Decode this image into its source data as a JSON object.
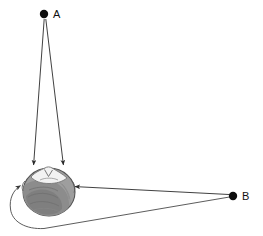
{
  "figure": {
    "background_color": "#ffffff",
    "width": 263,
    "height": 236
  },
  "sources": [
    {
      "id": "A",
      "label": "A",
      "label_x": 54,
      "label_y": 18,
      "dot_x": 44,
      "dot_y": 14,
      "dot_radius": 4.2,
      "color": "#0d0d0d",
      "description": "Source directly in front of and above the head, median plane"
    },
    {
      "id": "B",
      "label": "B",
      "label_x": 243,
      "label_y": 200,
      "dot_x": 233,
      "dot_y": 196,
      "dot_radius": 4.2,
      "color": "#0d0d0d",
      "description": "Source off to the right side of the head"
    }
  ],
  "rays": [
    {
      "name": "a-to-left-ear",
      "from": "A",
      "to": "left ear",
      "style": "straight",
      "arrowhead": true,
      "path": "M 44.5 18.5 L 33.5 166"
    },
    {
      "name": "a-to-right-ear",
      "from": "A",
      "to": "right ear",
      "style": "straight",
      "arrowhead": true,
      "path": "M 45.5 18.5 L 63.5 166"
    },
    {
      "name": "b-to-near-ear",
      "from": "B",
      "to": "near (right) ear",
      "style": "straight",
      "arrowhead": true,
      "path": "M 229.5 194.5 L 74 186.5"
    },
    {
      "name": "b-to-far-ear-diffracted",
      "from": "B",
      "to": "far (left) ear",
      "style": "curved-around-head",
      "arrowhead": true,
      "path": "M 229.5 197 L 44 228.5 C 26 229.5 12 222 10.5 209 C 9 198 13.5 189.5 21 185"
    }
  ],
  "head": {
    "name": "head-top-view",
    "center_x": 49,
    "center_y": 192,
    "radius_x": 26,
    "radius_y": 24,
    "fill_color": "#9e9e9e",
    "outline_color": "#555555",
    "face_color": "#f2f2f2",
    "orientation": "top-down view, nose pointing up"
  },
  "arrow_marker": {
    "color": "#2b2b2b",
    "size": 5
  }
}
